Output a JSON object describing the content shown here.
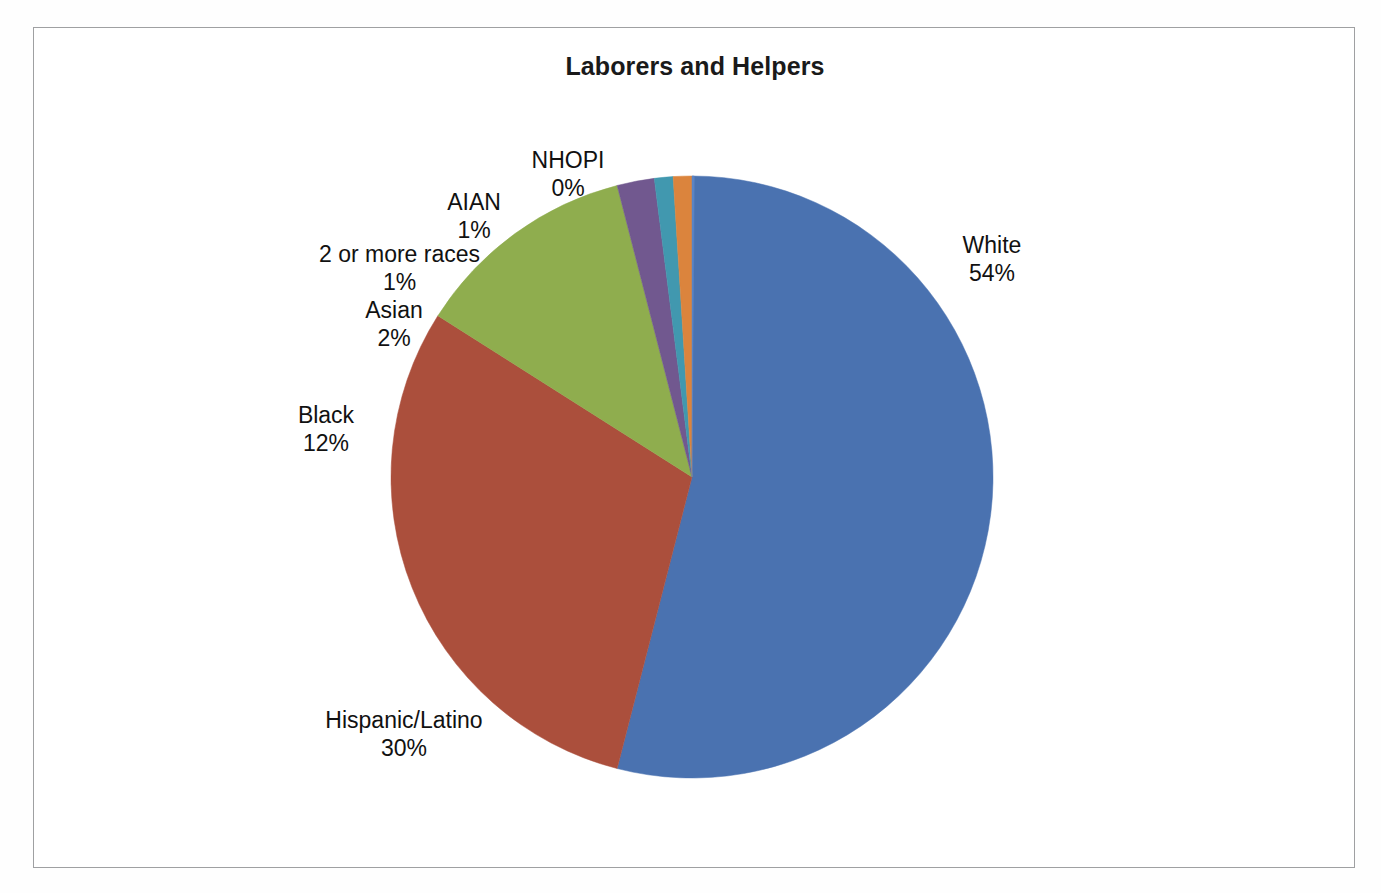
{
  "figure": {
    "title": "Laborers and Helpers",
    "background_color": "#ffffff",
    "border_color": "#9fa0a2"
  },
  "chart_data": {
    "type": "pie",
    "title": "Laborers and Helpers",
    "xlabel": "",
    "ylabel": "",
    "legend_position": "none",
    "labels_position": "outside-callout",
    "grid": false,
    "categories": [
      "White",
      "Hispanic/Latino",
      "Black",
      "Asian",
      "2 or more races",
      "AIAN",
      "NHOPI"
    ],
    "values": [
      54,
      30,
      12,
      2,
      1,
      1,
      0
    ],
    "value_labels": [
      "54%",
      "30%",
      "12%",
      "2%",
      "1%",
      "1%",
      "0%"
    ],
    "units": "percent",
    "colors": [
      "#4a72b0",
      "#ab4f3c",
      "#8fad4e",
      "#71588f",
      "#4198af",
      "#db843d",
      "#5b84c4"
    ],
    "slices": [
      {
        "name": "White",
        "value": 54,
        "value_label": "54%",
        "color": "#4a72b0",
        "label_text": "White",
        "label_align": "left"
      },
      {
        "name": "Hispanic/Latino",
        "value": 30,
        "value_label": "30%",
        "color": "#ab4f3c",
        "label_text": "Hispanic/Latino",
        "label_align": "center"
      },
      {
        "name": "Black",
        "value": 12,
        "value_label": "12%",
        "color": "#8fad4e",
        "label_text": "Black",
        "label_align": "center"
      },
      {
        "name": "Asian",
        "value": 2,
        "value_label": "2%",
        "color": "#71588f",
        "label_text": "Asian",
        "label_align": "center"
      },
      {
        "name": "2 or more races",
        "value": 1,
        "value_label": "1%",
        "color": "#4198af",
        "label_text": "2 or more races",
        "label_align": "center"
      },
      {
        "name": "AIAN",
        "value": 1,
        "value_label": "1%",
        "color": "#db843d",
        "label_text": "AIAN",
        "label_align": "center"
      },
      {
        "name": "NHOPI",
        "value": 0,
        "value_label": "0%",
        "color": "#5b84c4",
        "label_text": "NHOPI",
        "label_align": "center"
      }
    ]
  }
}
